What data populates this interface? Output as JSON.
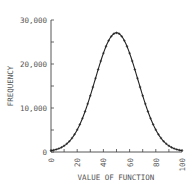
{
  "chart_data": {
    "type": "line",
    "title": "",
    "xlabel": "VALUE OF FUNCTION",
    "ylabel": "FREQUENCY",
    "xlim": [
      0,
      100
    ],
    "ylim": [
      0,
      30000
    ],
    "grid": false,
    "legend": null,
    "x_ticks": [
      0,
      20,
      40,
      60,
      80,
      100
    ],
    "x_tick_labels": [
      "0",
      "20",
      "40",
      "60",
      "80",
      "100"
    ],
    "x_minor_step": 10,
    "y_ticks": [
      0,
      10000,
      20000,
      30000
    ],
    "y_tick_labels": [
      "0",
      "10,000",
      "20,000",
      "30,000"
    ],
    "y_minor_step": 5000,
    "series": [
      {
        "name": "frequency",
        "marker": "+",
        "x": [
          0,
          2,
          4,
          6,
          8,
          10,
          12,
          14,
          16,
          18,
          20,
          22,
          24,
          26,
          28,
          30,
          32,
          34,
          36,
          38,
          40,
          42,
          44,
          46,
          48,
          50,
          52,
          54,
          56,
          58,
          60,
          62,
          64,
          66,
          68,
          70,
          72,
          74,
          76,
          78,
          80,
          82,
          84,
          86,
          88,
          90,
          92,
          94,
          96,
          98,
          100
        ],
        "values": [
          250,
          400,
          630,
          950,
          1400,
          2000,
          2800,
          3800,
          5000,
          6400,
          5000,
          6400,
          8000,
          9800,
          11700,
          12800,
          14800,
          16800,
          18800,
          20700,
          22400,
          23900,
          25200,
          26100,
          26800,
          27000,
          26800,
          26100,
          25200,
          23900,
          22400,
          20700,
          18800,
          16800,
          14800,
          12800,
          11700,
          9800,
          8000,
          6400,
          5000,
          3800,
          2800,
          2000,
          1400,
          950,
          630,
          400,
          250,
          150,
          100
        ]
      }
    ]
  }
}
